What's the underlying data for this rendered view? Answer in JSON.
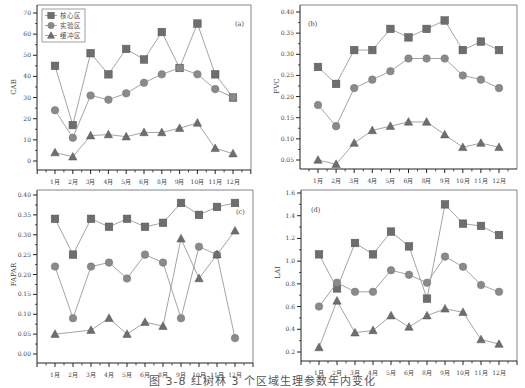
{
  "caption": "图 3-8  红树林 3 个区域生理参数年内变化",
  "legend": [
    {
      "name": "核心区",
      "marker": "square"
    },
    {
      "name": "实验区",
      "marker": "circle"
    },
    {
      "name": "缓冲区",
      "marker": "triangle"
    }
  ],
  "colors": {
    "marker": "#6e6e6e",
    "line": "#9a9a9a",
    "axis": "#222222"
  },
  "chart_data": [
    {
      "type": "line",
      "panel": "(a)",
      "ylabel": "CAB",
      "xlabel": "",
      "categories": [
        "1月",
        "2月",
        "3月",
        "4月",
        "5月",
        "6月",
        "8月",
        "9月",
        "10月",
        "11月",
        "12月"
      ],
      "ylim": [
        0,
        70
      ],
      "yticks": [
        0,
        10,
        20,
        30,
        40,
        50,
        60,
        70
      ],
      "legend_position": "upper-left",
      "grid": false,
      "series": [
        {
          "name": "核心区",
          "values": [
            45,
            17,
            51,
            41,
            53,
            48,
            61,
            44,
            65,
            41,
            30
          ]
        },
        {
          "name": "实验区",
          "values": [
            24,
            11,
            31,
            29,
            32,
            37,
            41,
            44,
            41,
            34,
            30
          ]
        },
        {
          "name": "缓冲区",
          "values": [
            4,
            2,
            12,
            12.5,
            11.5,
            13.5,
            13.5,
            15.5,
            18,
            6,
            3.5
          ]
        }
      ]
    },
    {
      "type": "line",
      "panel": "(b)",
      "ylabel": "FVC",
      "xlabel": "",
      "categories": [
        "1月",
        "2月",
        "3月",
        "4月",
        "5月",
        "6月",
        "8月",
        "9月",
        "10月",
        "11月",
        "12月"
      ],
      "ylim": [
        0.05,
        0.4
      ],
      "yticks": [
        0.05,
        0.1,
        0.15,
        0.2,
        0.25,
        0.3,
        0.35,
        0.4
      ],
      "grid": false,
      "series": [
        {
          "name": "核心区",
          "values": [
            0.27,
            0.23,
            0.31,
            0.31,
            0.36,
            0.34,
            0.36,
            0.38,
            0.31,
            0.33,
            0.31
          ]
        },
        {
          "name": "实验区",
          "values": [
            0.18,
            0.13,
            0.22,
            0.24,
            0.26,
            0.29,
            0.29,
            0.29,
            0.25,
            0.24,
            0.22
          ]
        },
        {
          "name": "缓冲区",
          "values": [
            0.05,
            0.04,
            0.09,
            0.12,
            0.13,
            0.14,
            0.14,
            0.11,
            0.08,
            0.09,
            0.08
          ]
        }
      ]
    },
    {
      "type": "line",
      "panel": "(c)",
      "ylabel": "FAPAR",
      "xlabel": "",
      "categories": [
        "1月",
        "2月",
        "3月",
        "4月",
        "5月",
        "6月",
        "8月",
        "9月",
        "10月",
        "11月",
        "12月"
      ],
      "ylim": [
        0.0,
        0.4
      ],
      "yticks": [
        0.0,
        0.05,
        0.1,
        0.15,
        0.2,
        0.25,
        0.3,
        0.35,
        0.4
      ],
      "grid": false,
      "series": [
        {
          "name": "核心区",
          "values": [
            0.34,
            0.25,
            0.34,
            0.32,
            0.34,
            0.32,
            0.33,
            0.38,
            0.35,
            0.37,
            0.38
          ]
        },
        {
          "name": "实验区",
          "values": [
            0.22,
            0.09,
            0.22,
            0.23,
            0.19,
            0.25,
            0.23,
            0.09,
            0.27,
            0.25,
            0.04
          ]
        },
        {
          "name": "缓冲区",
          "values": [
            0.05,
            null,
            0.06,
            0.09,
            0.05,
            0.08,
            0.07,
            0.29,
            0.19,
            0.25,
            0.31
          ]
        }
      ]
    },
    {
      "type": "line",
      "panel": "(d)",
      "ylabel": "LAI",
      "xlabel": "",
      "categories": [
        "1月",
        "2月",
        "3月",
        "4月",
        "5月",
        "6月",
        "8月",
        "9月",
        "10月",
        "11月",
        "12月"
      ],
      "ylim": [
        0.2,
        1.6
      ],
      "yticks": [
        0.2,
        0.4,
        0.6,
        0.8,
        1.0,
        1.2,
        1.4,
        1.6
      ],
      "grid": false,
      "series": [
        {
          "name": "核心区",
          "values": [
            1.06,
            0.76,
            1.16,
            1.06,
            1.26,
            1.13,
            0.67,
            1.5,
            1.33,
            1.31,
            1.23
          ]
        },
        {
          "name": "实验区",
          "values": [
            0.6,
            0.81,
            0.73,
            0.73,
            0.92,
            0.88,
            0.81,
            1.04,
            0.95,
            0.79,
            0.73
          ]
        },
        {
          "name": "缓冲区",
          "values": [
            0.24,
            0.65,
            0.37,
            0.39,
            0.52,
            0.42,
            0.52,
            0.58,
            0.55,
            0.31,
            0.27
          ]
        }
      ]
    }
  ],
  "layout": {
    "panels": [
      {
        "left": 37,
        "right": 251,
        "top": 13,
        "bottom": 161,
        "y_axis_line_top": 5,
        "tag_x": 235,
        "tag_y": 26
      },
      {
        "left": 300,
        "right": 517,
        "top": 12,
        "bottom": 160,
        "y_axis_line_top": 5,
        "tag_x": 308,
        "tag_y": 26
      },
      {
        "left": 37,
        "right": 253,
        "top": 195,
        "bottom": 354,
        "y_axis_line_top": 190,
        "tag_x": 236,
        "tag_y": 214
      },
      {
        "left": 301,
        "right": 517,
        "top": 193,
        "bottom": 352,
        "y_axis_line_top": 190,
        "tag_x": 311,
        "tag_y": 212
      }
    ]
  }
}
